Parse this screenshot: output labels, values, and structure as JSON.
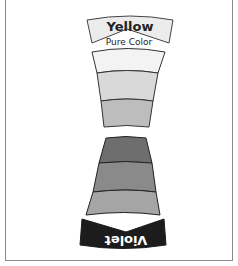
{
  "diagram": {
    "top_band": {
      "label": "Yellow",
      "fill": "#ececec",
      "stroke": "#444444"
    },
    "pure_label": "Pure Color",
    "upper_wedge": {
      "segments": [
        {
          "name": "tint-1",
          "fill": "#f3f3f3"
        },
        {
          "name": "tint-2",
          "fill": "#d9d9d9"
        },
        {
          "name": "tint-3",
          "fill": "#bdbdbd"
        }
      ],
      "stroke": "#333333"
    },
    "lower_wedge": {
      "segments": [
        {
          "name": "shade-1",
          "fill": "#6e6e6e"
        },
        {
          "name": "shade-2",
          "fill": "#8a8a8a"
        },
        {
          "name": "shade-3",
          "fill": "#a5a5a5"
        }
      ],
      "stroke": "#222222"
    },
    "bottom_band": {
      "label": "Violet",
      "fill": "#1c1c1c",
      "text_color": "#ffffff"
    },
    "frame_border": "#8a8a8a"
  }
}
